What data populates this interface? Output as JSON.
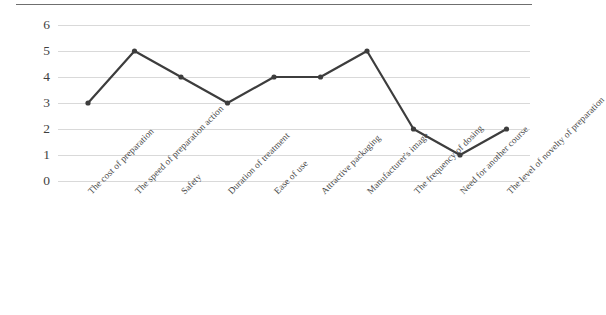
{
  "chart_data": {
    "type": "line",
    "title": "",
    "subtitle": "",
    "xlabel": "",
    "ylabel": "",
    "ylim": [
      0,
      6
    ],
    "yticks": [
      0,
      1,
      2,
      3,
      4,
      5,
      6
    ],
    "grid": true,
    "legend": false,
    "legend_position": "none",
    "xtick_rotation": -45,
    "series_color": "#3d3d3d",
    "grid_color": "#d9d9d9",
    "marker": "circle",
    "categories": [
      "The cost of preparation",
      "The speed of preparation action",
      "Safety",
      "Duration of treatment",
      "Ease of use",
      "Attractive packaging",
      "Manufacturer's image",
      "The frequency of dosing",
      "Need for another course",
      "The level of novelty of preparation"
    ],
    "values": [
      3,
      5,
      4,
      3,
      4,
      4,
      5,
      2,
      1,
      2
    ],
    "series": [
      {
        "name": "Rank",
        "values": [
          3,
          5,
          4,
          3,
          4,
          4,
          5,
          2,
          1,
          2
        ]
      }
    ]
  },
  "axes": {
    "y_tick_labels": [
      "6",
      "5",
      "4",
      "3",
      "2",
      "1",
      "0"
    ],
    "x_tick_labels": [
      "The cost of preparation",
      "The speed of preparation action",
      "Safety",
      "Duration of treatment",
      "Ease of use",
      "Attractive packaging",
      "Manufacturer's image",
      "The frequency of dosing",
      "Need for another course",
      "The level of novelty of preparation"
    ]
  }
}
